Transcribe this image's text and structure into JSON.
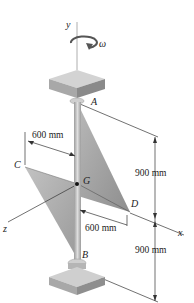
{
  "diagram": {
    "type": "engineering-mechanics-figure",
    "axes": {
      "y": "y",
      "x": "x",
      "z": "z"
    },
    "angular_velocity": "ω",
    "points": {
      "A": "A",
      "B": "B",
      "C": "C",
      "D": "D",
      "G": "G"
    },
    "dimensions": {
      "upper_horizontal": "600 mm",
      "lower_horizontal": "600 mm",
      "upper_vertical": "900 mm",
      "lower_vertical": "900 mm"
    },
    "colors": {
      "plate": "#a9a9a9",
      "plate_dark": "#8f8f8f",
      "shaft": "#c4c4c4",
      "bearing_top": "#d0d0d0",
      "bearing_side": "#9a9a9a",
      "line": "#333333",
      "background": "#ffffff"
    }
  }
}
